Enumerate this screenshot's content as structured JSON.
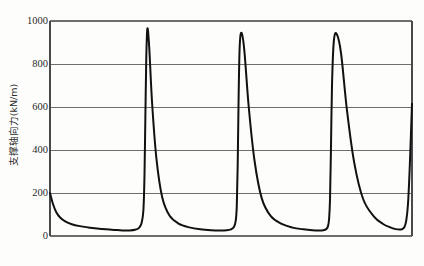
{
  "chart_data": {
    "type": "line",
    "title": "",
    "subtitle": "",
    "xlabel": "",
    "ylabel": "支撑轴向力(kN/m)",
    "ylim": [
      0,
      1000
    ],
    "xlim": [
      0,
      100
    ],
    "yticks": [
      0,
      200,
      400,
      600,
      800,
      1000
    ],
    "ytick_labels": [
      "0",
      "200",
      "400",
      "600",
      "800",
      "1000"
    ],
    "xticks": [],
    "xtick_labels": [],
    "grid": "horizontal",
    "grid_color": "#6e6e6e",
    "frame": true,
    "frame_color": "#4a4a4a",
    "legend": null,
    "legend_position": "none",
    "annotations": [],
    "series": [
      {
        "name": "支撑轴向力",
        "color": "#111111",
        "line_width": 2,
        "x": [
          0.0,
          0.8,
          1.7,
          2.8,
          4.2,
          6.0,
          8.2,
          10.5,
          13.0,
          15.5,
          18.0,
          20.0,
          22.0,
          23.5,
          24.6,
          25.3,
          25.8,
          26.1,
          26.35,
          26.6,
          26.9,
          27.4,
          28.2,
          29.4,
          31.0,
          33.0,
          35.5,
          38.5,
          41.5,
          44.5,
          47.0,
          48.8,
          50.0,
          50.8,
          51.3,
          51.6,
          51.85,
          52.1,
          52.4,
          52.9,
          53.7,
          54.9,
          56.5,
          58.5,
          61.0,
          64.0,
          67.0,
          70.0,
          72.5,
          74.3,
          75.5,
          76.3,
          76.8,
          77.1,
          77.35,
          77.6,
          77.9,
          78.4,
          79.2,
          80.4,
          82.0,
          84.0,
          86.5,
          89.5,
          92.0,
          94.0,
          95.5,
          96.5,
          97.3,
          97.9,
          98.4,
          98.9,
          99.4,
          100.0
        ],
        "y": [
          200,
          150,
          112,
          86,
          68,
          55,
          46,
          40,
          35,
          31,
          28,
          26,
          26,
          29,
          38,
          60,
          120,
          280,
          560,
          830,
          965,
          880,
          620,
          360,
          180,
          95,
          58,
          40,
          31,
          27,
          26,
          27,
          31,
          42,
          70,
          140,
          330,
          640,
          880,
          945,
          860,
          600,
          350,
          175,
          92,
          56,
          39,
          31,
          27,
          26,
          27,
          32,
          46,
          80,
          170,
          390,
          700,
          905,
          940,
          850,
          590,
          345,
          172,
          90,
          56,
          40,
          32,
          30,
          32,
          42,
          70,
          150,
          330,
          615
        ]
      }
    ]
  },
  "axis": {
    "tick_0": "0",
    "tick_200": "200",
    "tick_400": "400",
    "tick_600": "600",
    "tick_800": "800",
    "tick_1000": "1000",
    "y_title": "支撑轴向力(kN/m)"
  }
}
